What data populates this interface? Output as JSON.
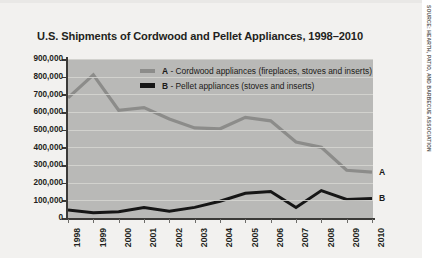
{
  "chart_data": {
    "type": "line",
    "title": "U.S. Shipments of Cordwood and Pellet Appliances, 1998–2010",
    "xlabel": "",
    "ylabel": "",
    "categories": [
      "1998",
      "1999",
      "2000",
      "2001",
      "2002",
      "2003",
      "2004",
      "2005",
      "2006",
      "2007",
      "2008",
      "2009",
      "2010"
    ],
    "ylim": [
      0,
      900000
    ],
    "yticks": [
      0,
      100000,
      200000,
      300000,
      400000,
      500000,
      600000,
      700000,
      800000,
      900000
    ],
    "ytick_labels": [
      "0",
      "100,000",
      "200,000",
      "300,000",
      "400,000",
      "500,000",
      "600,000",
      "700,000",
      "800,000",
      "900,000"
    ],
    "grid": true,
    "legend_position": "inside-top-center",
    "series": [
      {
        "name": "A - Cordwood appliances (fireplaces, stoves and inserts)",
        "key": "A",
        "color": "#8c8c8a",
        "end_label": "A",
        "values": [
          680000,
          810000,
          610000,
          625000,
          560000,
          510000,
          505000,
          570000,
          550000,
          430000,
          400000,
          270000,
          260000
        ]
      },
      {
        "name": "B - Pellet appliances (stoves and inserts)",
        "key": "B",
        "color": "#161616",
        "end_label": "B",
        "values": [
          45000,
          30000,
          35000,
          60000,
          38000,
          60000,
          95000,
          140000,
          150000,
          60000,
          155000,
          105000,
          110000
        ]
      }
    ]
  },
  "legend": {
    "items": [
      {
        "key": "A",
        "separator": " - ",
        "label": "Cordwood appliances (fireplaces, stoves and inserts)"
      },
      {
        "key": "B",
        "separator": " - ",
        "label": "Pellet appliances (stoves and inserts)"
      }
    ]
  },
  "credit": {
    "source_text": "SOURCE: HEARTH, PATIO, AND BARBECUE ASSOCIATION"
  },
  "colors": {
    "series_a": "#8c8c8a",
    "series_b": "#161616",
    "plot_background": "#b9b9b7",
    "panel_background": "#f2f1ef",
    "gridline": "#d6d6d2",
    "axis": "#3b3a38",
    "text": "#231f20"
  }
}
